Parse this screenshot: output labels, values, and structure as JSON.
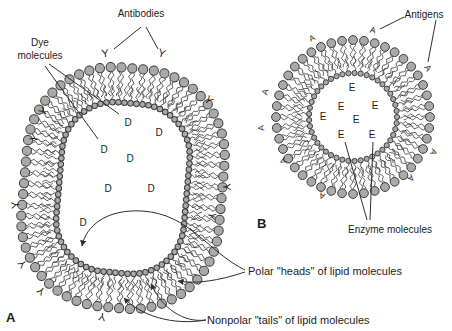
{
  "palette": {
    "background": "#ffffff",
    "head_fill": "#a9a9a9",
    "head_stroke": "#3d3d3d",
    "tail_stroke": "#3c3c3c",
    "line": "#2e2e2e",
    "text": "#1c1c1c"
  },
  "annotations": {
    "antibodies": "Antibodies",
    "dye_line1": "Dye",
    "dye_line2": "molecules",
    "antigens": "Antigens",
    "enzymes": "Enzyme molecules",
    "polar": "Polar \"heads\" of lipid molecules",
    "nonpolar": "Nonpolar \"tails\" of lipid molecules",
    "panel_a": "A",
    "panel_b": "B"
  },
  "liposome_a": {
    "shape": "rounded-rect",
    "center": [
      123,
      188
    ],
    "rotation": 5,
    "lumen_width": 128,
    "lumen_height": 170,
    "corner_radius": 52,
    "bilayer_gap": 35,
    "inner_heads": 84,
    "outer_heads": 67,
    "inner_head_radius": 2.8,
    "outer_head_radius": 4.6,
    "content_letter": "D",
    "content_positions": [
      [
        128,
        122
      ],
      [
        159,
        132
      ],
      [
        104,
        149
      ],
      [
        130,
        158
      ],
      [
        108,
        188
      ],
      [
        151,
        188
      ],
      [
        83,
        222
      ]
    ],
    "antibody_letter": "Y",
    "antibody_positions": [
      [
        105,
        53
      ],
      [
        162,
        53
      ],
      [
        209,
        100
      ],
      [
        227,
        187
      ],
      [
        212,
        216
      ],
      [
        43,
        111
      ],
      [
        34,
        138
      ],
      [
        15,
        205
      ],
      [
        22,
        264
      ],
      [
        41,
        291
      ],
      [
        102,
        317
      ]
    ]
  },
  "liposome_b": {
    "shape": "circle",
    "center": [
      353,
      117
    ],
    "lumen_radius": 44,
    "bilayer_gap": 33,
    "inner_heads": 45,
    "outer_heads": 44,
    "inner_head_radius": 2.6,
    "outer_head_radius": 4.4,
    "content_letter": "E",
    "content_positions": [
      [
        352,
        87
      ],
      [
        341,
        106
      ],
      [
        375,
        105
      ],
      [
        323,
        116
      ],
      [
        356,
        119
      ],
      [
        341,
        134
      ],
      [
        372,
        134
      ]
    ],
    "antigen_letter": "A",
    "antigen_positions": [
      [
        312,
        38
      ],
      [
        373,
        30
      ],
      [
        428,
        68
      ],
      [
        265,
        92
      ],
      [
        261,
        128
      ],
      [
        434,
        152
      ],
      [
        283,
        161
      ],
      [
        411,
        178
      ],
      [
        322,
        196
      ]
    ]
  }
}
